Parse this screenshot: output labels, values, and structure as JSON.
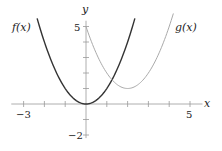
{
  "chart_data": {
    "type": "line",
    "title": "",
    "xlabel": "x",
    "ylabel": "y",
    "xlim": [
      -3.4,
      5.6
    ],
    "ylim": [
      -2.2,
      5.5
    ],
    "x_ticks": [
      -3,
      -2,
      -1,
      0,
      1,
      2,
      3,
      4,
      5
    ],
    "y_ticks": [
      -2,
      -1,
      0,
      1,
      2,
      3,
      4,
      5
    ],
    "x_tick_labels": {
      "-3": "−3",
      "5": "5"
    },
    "y_tick_labels": {
      "-2": "−2",
      "5": "5"
    },
    "grid": false,
    "series": [
      {
        "name": "f(x)",
        "formula": "x^2",
        "x": [
          -2.35,
          -2,
          -1.5,
          -1,
          -0.5,
          0,
          0.5,
          1,
          1.5,
          2,
          2.35
        ],
        "values": [
          5.52,
          4,
          2.25,
          1,
          0.25,
          0,
          0.25,
          1,
          2.25,
          4,
          5.52
        ],
        "color": "#333333"
      },
      {
        "name": "g(x)",
        "formula": "(x-2)^2+1",
        "x": [
          0,
          0.5,
          1,
          1.5,
          2,
          2.5,
          3,
          3.5,
          4,
          4.2
        ],
        "values": [
          5,
          3.25,
          2,
          1.25,
          1,
          1.25,
          2,
          3.25,
          5,
          5.84
        ],
        "color": "#aaaaaa"
      }
    ],
    "labels": {
      "f": "f(x)",
      "g": "g(x)",
      "x_axis": "x",
      "y_axis": "y",
      "x_min": "−3",
      "x_max": "5",
      "y_min": "−2",
      "y_max": "5"
    }
  }
}
